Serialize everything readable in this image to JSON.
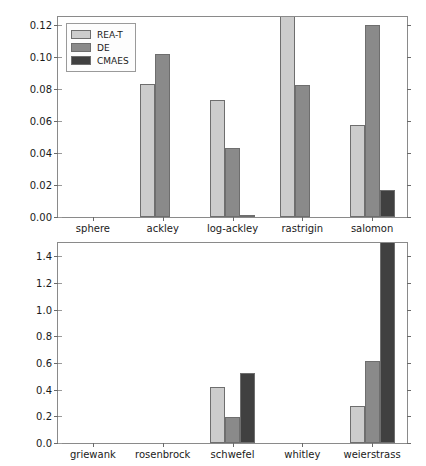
{
  "figure": {
    "width": 426,
    "height": 466,
    "background": "#ffffff"
  },
  "legend": {
    "position": "upper-left",
    "entries": [
      {
        "label": "REA-T",
        "color": "#cccccc"
      },
      {
        "label": "DE",
        "color": "#8a8a8a"
      },
      {
        "label": "CMAES",
        "color": "#404040"
      }
    ]
  },
  "series_colors": {
    "REA-T": "#cccccc",
    "DE": "#8a8a8a",
    "CMAES": "#404040",
    "edge": "#6e6e6e"
  },
  "chart_data": [
    {
      "id": "top",
      "type": "bar",
      "title": "",
      "xlabel": "",
      "ylabel": "",
      "grid": false,
      "legend_position": "upper left",
      "ylim": [
        0.0,
        0.125
      ],
      "yticks": [
        0.0,
        0.02,
        0.04,
        0.06,
        0.08,
        0.1,
        0.12
      ],
      "ytick_labels": [
        "0.00",
        "0.02",
        "0.04",
        "0.06",
        "0.08",
        "0.10",
        "0.12"
      ],
      "categories": [
        "sphere",
        "ackley",
        "log-ackley",
        "rastrigin",
        "salomon"
      ],
      "series": [
        {
          "name": "REA-T",
          "values": [
            0.0,
            0.083,
            0.0732,
            0.125,
            0.0578
          ]
        },
        {
          "name": "DE",
          "values": [
            0.0,
            0.102,
            0.0432,
            0.0827,
            0.12
          ]
        },
        {
          "name": "CMAES",
          "values": [
            0.0,
            0.0,
            0.0007,
            0.0,
            0.017
          ]
        }
      ],
      "clipped_bars": [
        "rastrigin/REA-T"
      ]
    },
    {
      "id": "bottom",
      "type": "bar",
      "title": "",
      "xlabel": "",
      "ylabel": "",
      "grid": false,
      "legend_position": "none",
      "ylim": [
        0.0,
        1.5
      ],
      "yticks": [
        0.0,
        0.2,
        0.4,
        0.6,
        0.8,
        1.0,
        1.2,
        1.4
      ],
      "ytick_labels": [
        "0.0",
        "0.2",
        "0.4",
        "0.6",
        "0.8",
        "1.0",
        "1.2",
        "1.4"
      ],
      "categories": [
        "griewank",
        "rosenbrock",
        "schwefel",
        "whitley",
        "weierstrass"
      ],
      "series": [
        {
          "name": "REA-T",
          "values": [
            0.0,
            0.0,
            0.422,
            0.0,
            0.28
          ]
        },
        {
          "name": "DE",
          "values": [
            0.0,
            0.0,
            0.192,
            0.0,
            0.612
          ]
        },
        {
          "name": "CMAES",
          "values": [
            0.0,
            0.0,
            0.528,
            0.0,
            1.5
          ]
        }
      ],
      "clipped_bars": [
        "weierstrass/CMAES"
      ]
    }
  ]
}
